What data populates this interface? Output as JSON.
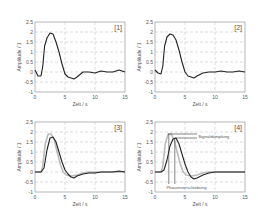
{
  "chart_data": [
    {
      "type": "line",
      "panel_label": "[1]",
      "xlabel": "Zeit / s",
      "ylabel": "Amplitude / 1",
      "xlim": [
        0,
        15
      ],
      "ylim": [
        -1,
        2.5
      ],
      "xticks": [
        0,
        5,
        10,
        15
      ],
      "yticks": [
        -1,
        -0.5,
        0,
        0.5,
        1,
        1.5,
        2,
        2.5
      ],
      "grid": true,
      "series": [
        {
          "name": "noisy signal",
          "color": "#222222",
          "x": [
            0,
            0.5,
            1,
            1.3,
            1.6,
            2,
            2.5,
            3,
            3.5,
            4,
            4.5,
            5,
            5.5,
            6,
            6.5,
            7,
            8,
            9,
            10,
            11,
            12,
            13,
            14,
            15
          ],
          "y": [
            0.1,
            -0.2,
            -0.2,
            0.3,
            1.3,
            1.7,
            1.95,
            1.9,
            1.5,
            1.0,
            0.4,
            -0.1,
            -0.25,
            -0.3,
            -0.35,
            -0.25,
            0,
            0,
            -0.05,
            0.05,
            0,
            0,
            0.1,
            0
          ]
        }
      ]
    },
    {
      "type": "line",
      "panel_label": "[2]",
      "xlabel": "Zeit / s",
      "ylabel": "Amplitude / 1",
      "xlim": [
        0,
        15
      ],
      "ylim": [
        -1,
        2.5
      ],
      "xticks": [
        0,
        5,
        10,
        15
      ],
      "yticks": [
        -1,
        -0.5,
        0,
        0.5,
        1,
        1.5,
        2,
        2.5
      ],
      "grid": true,
      "series": [
        {
          "name": "filtered signal",
          "color": "#222222",
          "x": [
            0,
            0.5,
            1,
            1.3,
            1.6,
            2,
            2.5,
            3,
            3.5,
            4,
            4.5,
            5,
            5.5,
            6,
            6.5,
            7,
            8,
            9,
            10,
            11,
            12,
            13,
            14,
            15
          ],
          "y": [
            0.1,
            -0.05,
            -0.1,
            0.3,
            1.3,
            1.75,
            1.9,
            1.85,
            1.6,
            1.1,
            0.5,
            0,
            -0.2,
            -0.25,
            -0.3,
            -0.2,
            -0.05,
            0,
            0,
            0.05,
            0,
            0,
            0.05,
            0
          ]
        }
      ]
    },
    {
      "type": "line",
      "panel_label": "[3]",
      "xlabel": "Zeit / s",
      "ylabel": "Amplitude / 1",
      "xlim": [
        0,
        15
      ],
      "ylim": [
        -1,
        2.5
      ],
      "xticks": [
        0,
        5,
        10,
        15
      ],
      "yticks": [
        -1,
        -0.5,
        0,
        0.5,
        1,
        1.5,
        2,
        2.5
      ],
      "grid": true,
      "series": [
        {
          "name": "reference",
          "color": "#bbbbbb",
          "x": [
            0,
            1,
            1.3,
            1.7,
            2.2,
            2.7,
            3.2,
            3.7,
            4.2,
            4.7,
            5.2,
            6,
            7,
            8,
            9,
            10,
            11,
            12,
            13,
            14,
            15
          ],
          "y": [
            0,
            0,
            0.3,
            1.4,
            1.9,
            1.9,
            1.6,
            1.0,
            0.4,
            0,
            -0.15,
            -0.2,
            -0.15,
            -0.05,
            0,
            0,
            0,
            0,
            0,
            0,
            0
          ]
        },
        {
          "name": "measured",
          "color": "#222222",
          "x": [
            0,
            1,
            1.5,
            2,
            2.5,
            3,
            3.5,
            4,
            4.5,
            5,
            5.5,
            6,
            6.5,
            7,
            8,
            9,
            10,
            11,
            12,
            13,
            14,
            15
          ],
          "y": [
            0,
            0,
            0.2,
            1.1,
            1.7,
            1.75,
            1.5,
            1.0,
            0.5,
            0.1,
            -0.1,
            -0.25,
            -0.3,
            -0.2,
            -0.1,
            -0.05,
            -0.05,
            0,
            0,
            0,
            0.05,
            0
          ]
        }
      ]
    },
    {
      "type": "line",
      "panel_label": "[4]",
      "xlabel": "Zeit / s",
      "ylabel": "Amplitude / 1",
      "xlim": [
        0,
        15
      ],
      "ylim": [
        -1,
        2.5
      ],
      "xticks": [
        0,
        5,
        10,
        15
      ],
      "yticks": [
        -1,
        -0.5,
        0,
        0.5,
        1,
        1.5,
        2,
        2.5
      ],
      "grid": true,
      "annotations": [
        {
          "text": "Signaldämpfung",
          "x": 7.2,
          "y": 1.8
        },
        {
          "text": "Phasenverschiebung",
          "x": 2.5,
          "y": -0.75
        }
      ],
      "series": [
        {
          "name": "reference",
          "color": "#bbbbbb",
          "x": [
            0,
            1,
            1.3,
            1.7,
            2.2,
            2.7,
            3.2,
            3.7,
            4.2,
            4.7,
            5.2,
            6,
            7,
            8,
            9,
            10,
            11,
            12,
            13,
            14,
            15
          ],
          "y": [
            0,
            0,
            0.3,
            1.4,
            1.9,
            1.9,
            1.6,
            1.0,
            0.4,
            0,
            -0.15,
            -0.2,
            -0.15,
            -0.05,
            0,
            0,
            0,
            0,
            0,
            0,
            0
          ]
        },
        {
          "name": "measured",
          "color": "#222222",
          "x": [
            0,
            1,
            1.5,
            2,
            2.5,
            3,
            3.5,
            4,
            4.5,
            5,
            5.5,
            6,
            6.5,
            7,
            8,
            9,
            10,
            11,
            12,
            13,
            14,
            15
          ],
          "y": [
            0,
            0,
            0.1,
            0.6,
            1.3,
            1.65,
            1.7,
            1.4,
            0.9,
            0.4,
            0,
            -0.25,
            -0.35,
            -0.3,
            -0.15,
            -0.05,
            0,
            0,
            0,
            0,
            0,
            0
          ]
        }
      ]
    }
  ],
  "labels": {
    "p1": "[1]",
    "p2": "[2]",
    "p3": "[3]",
    "p4": "[4]",
    "xlabel": "Zeit / s",
    "ylabel": "Amplitude / 1",
    "signal_damping": "Signaldämpfung",
    "phase_shift": "Phasenverschiebung"
  }
}
